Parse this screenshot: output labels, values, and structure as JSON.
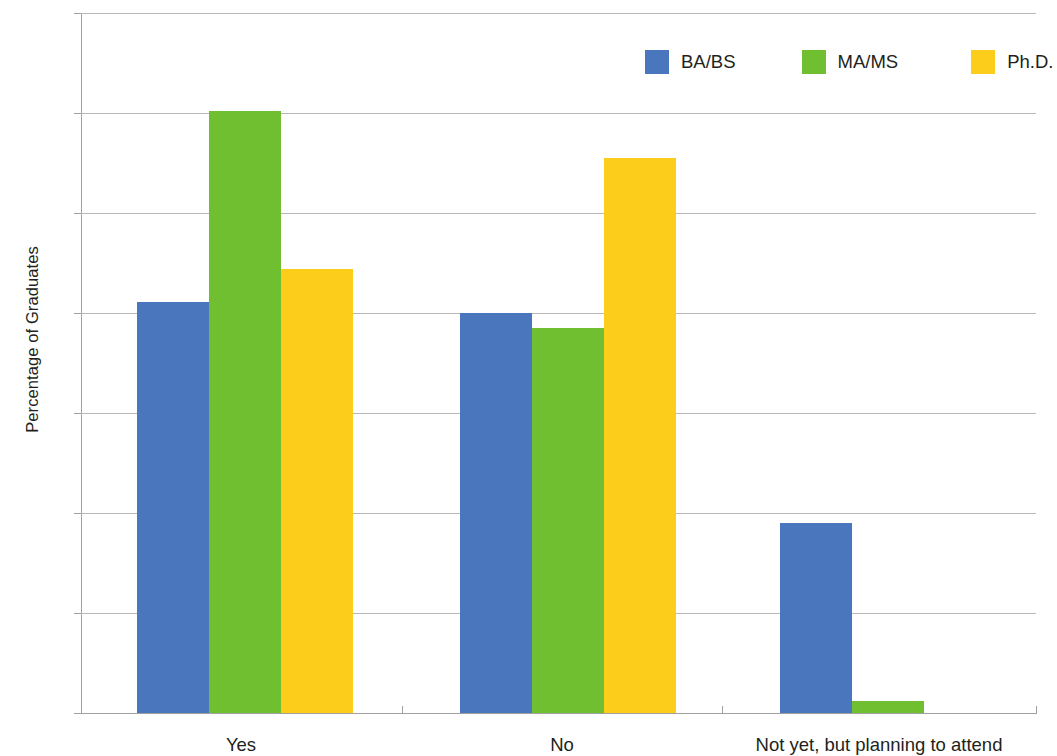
{
  "chart_data": {
    "type": "bar",
    "title": "",
    "subtitle": "",
    "xlabel": "",
    "ylabel": "Percentage of Graduates",
    "categories": [
      "Yes",
      "No",
      "Not yet, but planning to attend"
    ],
    "series": [
      {
        "name": "BA/BS",
        "color": "#4a76bd",
        "values": [
          41.1,
          40.0,
          19.0
        ]
      },
      {
        "name": "MA/MS",
        "color": "#70bf31",
        "values": [
          60.2,
          38.5,
          1.2
        ]
      },
      {
        "name": "Ph.D.",
        "color": "#fdcd1b",
        "values": [
          44.4,
          55.5,
          0
        ]
      }
    ],
    "ylim": [
      0,
      70
    ],
    "ytick_values": [
      0,
      10,
      20,
      30,
      40,
      50,
      60,
      70
    ],
    "ytick_labels": [
      "0%",
      "10%",
      "20%",
      "30%",
      "40%",
      "50%",
      "60%",
      "70%"
    ],
    "grid": "horizontal",
    "legend_position": "top-right",
    "value_format": "percent",
    "bar_group_layout": "grouped"
  },
  "axis": {
    "y_title": "Percentage of Graduates"
  },
  "legend": {
    "items": [
      {
        "label": "BA/BS",
        "color": "#4a76bd"
      },
      {
        "label": "MA/MS",
        "color": "#70bf31"
      },
      {
        "label": "Ph.D.",
        "color": "#fdcd1b"
      }
    ]
  },
  "colors": {
    "ba_bs": "#4a76bd",
    "ma_ms": "#70bf31",
    "phd": "#fdcd1b",
    "grid": "#b8b8b8",
    "axis": "#a0a0a0",
    "text": "#231f20",
    "background": "#ffffff"
  }
}
